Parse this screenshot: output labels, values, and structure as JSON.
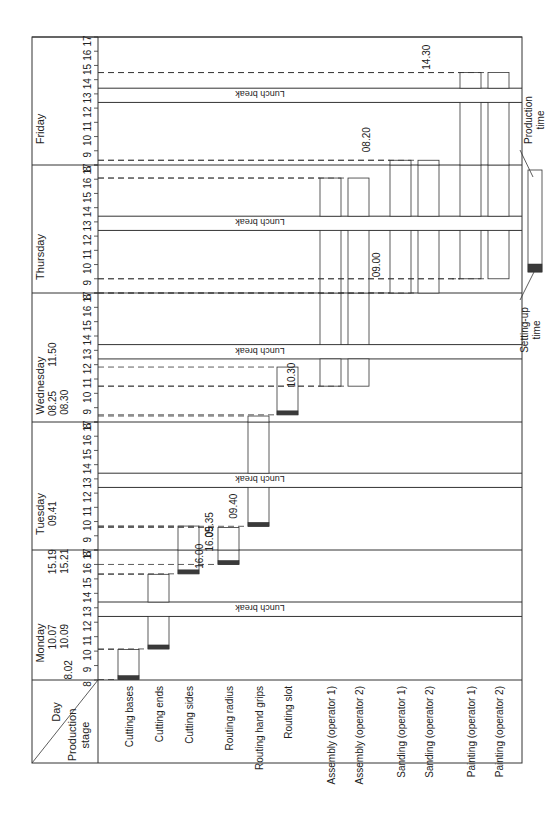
{
  "chart_data": {
    "type": "gantt",
    "title": "",
    "orientation": "rotated-90-ccw",
    "corner_header": {
      "top": "Day",
      "bottom": "Production stage"
    },
    "days": [
      "Monday",
      "Tuesday",
      "Wednesday",
      "Thursday",
      "Friday"
    ],
    "hour_ticks": [
      "8",
      "9",
      "10",
      "11",
      "12",
      "13",
      "14",
      "15",
      "16",
      "17"
    ],
    "lunch_break": {
      "label": "Lunch break",
      "start": 12.4,
      "end": 13.4
    },
    "stages": [
      "Cutting bases",
      "Cutting ends",
      "Cutting sides",
      "Routing radius",
      "Routing hand grips",
      "Routing slot",
      "Assembly (operator 1)",
      "Assembly (operator 2)",
      "Sanding (operator 1)",
      "Sanding (operator 2)",
      "Painting (operator 1)",
      "Painting (operator 2)"
    ],
    "tasks": [
      {
        "stage": "Cutting bases",
        "start": {
          "day": "Monday",
          "time": "08.02"
        },
        "end": {
          "day": "Monday",
          "time": "10.07"
        },
        "setup": true
      },
      {
        "stage": "Cutting ends",
        "start": {
          "day": "Monday",
          "time": "10.09"
        },
        "end": {
          "day": "Monday",
          "time": "15.19"
        },
        "setup": true
      },
      {
        "stage": "Cutting sides",
        "start": {
          "day": "Monday",
          "time": "15.21"
        },
        "end": {
          "day": "Tuesday",
          "time": "09.41"
        },
        "setup": true
      },
      {
        "stage": "Routing radius",
        "start": {
          "day": "Monday",
          "time": "16.00"
        },
        "end": {
          "day": "Tuesday",
          "time": "09.35"
        },
        "setup": true
      },
      {
        "stage": "Routing hand grips",
        "start": {
          "day": "Tuesday",
          "time": "09.40"
        },
        "end": {
          "day": "Wednesday",
          "time": "08.25"
        },
        "setup": true
      },
      {
        "stage": "Routing slot",
        "start": {
          "day": "Wednesday",
          "time": "08.30"
        },
        "end": {
          "day": "Wednesday",
          "time": "11.50"
        },
        "setup": true
      },
      {
        "stage": "Assembly (operator 1)",
        "start": {
          "day": "Wednesday",
          "time": "10.30"
        },
        "end": {
          "day": "Thursday",
          "time": "16.05"
        },
        "setup": false
      },
      {
        "stage": "Assembly (operator 2)",
        "start": {
          "day": "Wednesday",
          "time": "10.30"
        },
        "end": {
          "day": "Thursday",
          "time": "16.05"
        },
        "setup": false
      },
      {
        "stage": "Sanding (operator 1)",
        "start": {
          "day": "Thursday",
          "time": "08.00"
        },
        "end": {
          "day": "Friday",
          "time": "08.20"
        },
        "setup": false
      },
      {
        "stage": "Sanding (operator 2)",
        "start": {
          "day": "Thursday",
          "time": "08.00"
        },
        "end": {
          "day": "Friday",
          "time": "08.20"
        },
        "setup": false
      },
      {
        "stage": "Painting (operator 1)",
        "start": {
          "day": "Thursday",
          "time": "09.00"
        },
        "end": {
          "day": "Friday",
          "time": "14.30"
        },
        "setup": false
      },
      {
        "stage": "Painting (operator 2)",
        "start": {
          "day": "Thursday",
          "time": "09.00"
        },
        "end": {
          "day": "Friday",
          "time": "14.30"
        },
        "setup": false
      }
    ],
    "annotations": [
      "8.02",
      "10.07",
      "10.09",
      "15.19",
      "15.21",
      "16.00",
      "16.05",
      "09.35",
      "09.40",
      "09.41",
      "08.25",
      "08.30",
      "10.30",
      "11.50",
      "09.00",
      "08.20",
      "14.30"
    ],
    "legend": {
      "setup_label": "Setting-up time",
      "production_label": "Production time"
    },
    "colors": {
      "line": "#333333",
      "setup": "#3a3a3a",
      "background": "#ffffff"
    }
  }
}
